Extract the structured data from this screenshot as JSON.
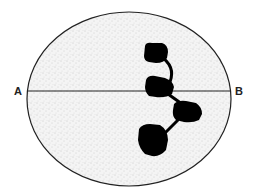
{
  "diagram": {
    "type": "cell-division-metaphase-plate",
    "labels": {
      "left": "A",
      "right": "B"
    },
    "cell": {
      "shape": "ellipse",
      "fill": "stippled-grey",
      "outline_color": "#222222"
    },
    "axis_line": {
      "from": "A",
      "to": "B",
      "color": "#222222"
    },
    "chromosome_blobs": [
      {
        "id": 1,
        "position": "top"
      },
      {
        "id": 2,
        "position": "on-line"
      },
      {
        "id": 3,
        "position": "right-below-line"
      },
      {
        "id": 4,
        "position": "bottom-left"
      }
    ],
    "connectors": [
      {
        "from": 1,
        "to": 2
      },
      {
        "from": 2,
        "to": 3
      },
      {
        "from": 3,
        "to": 4
      }
    ],
    "colors": {
      "blob": "#000000",
      "stipple": "#9a9a9a",
      "background": "#ffffff"
    }
  }
}
